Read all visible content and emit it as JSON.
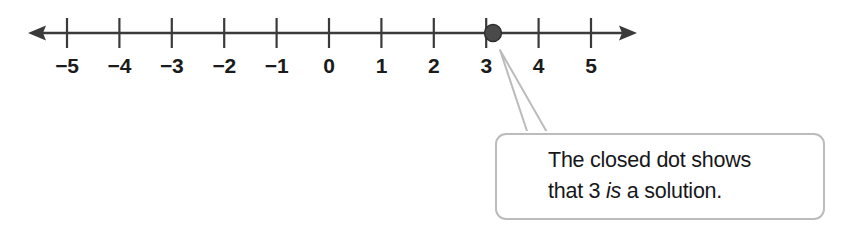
{
  "figure": {
    "name": "number-line-with-closed-dot-callout",
    "background_color": "#ffffff"
  },
  "number_line": {
    "axis_color": "#333333",
    "label_color": "#1b1b1b",
    "tick_values": [
      -5,
      -4,
      -3,
      -2,
      -1,
      0,
      1,
      2,
      3,
      4,
      5
    ],
    "tick_labels": [
      "−5",
      "−4",
      "−3",
      "−2",
      "−1",
      "0",
      "1",
      "2",
      "3",
      "4",
      "5"
    ],
    "left_arrow": true,
    "right_arrow": true,
    "axis_y": 33,
    "tick_top": 18,
    "tick_bottom": 48,
    "first_tick_x": 67,
    "tick_spacing": 52.4,
    "left_arrow_tip_x": 28,
    "right_arrow_tip_x": 637
  },
  "point_marker": {
    "type": "closed-dot",
    "value": 3,
    "x": 493,
    "y": 33,
    "radius": 8.5,
    "fill_color": "#4a4a4a",
    "stroke_color": "#2e2e2e"
  },
  "callout": {
    "border_color": "#bcbcbc",
    "background_color": "#ffffff",
    "text_line_1": "The closed dot shows",
    "text_line_2_prefix": "that 3 ",
    "text_line_2_italic": "is",
    "text_line_2_suffix": " a solution.",
    "pointer_apex_x": 504,
    "pointer_apex_y": 54,
    "pointer_base_left_x": 528,
    "pointer_base_right_x": 548,
    "pointer_base_y": 134
  }
}
